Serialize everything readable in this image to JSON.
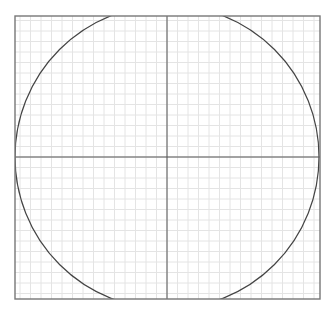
{
  "diagram": {
    "type": "circle-on-grid",
    "frame": {
      "x": 15,
      "y": 16,
      "width": 305,
      "height": 283
    },
    "center": {
      "x": 167,
      "y": 157
    },
    "circle_radius": 152,
    "grid_spacing": 10.5,
    "colors": {
      "background": "#ffffff",
      "grid": "#e4e4e4",
      "frame": "#777777",
      "axes": "#555555",
      "circle": "#444444"
    }
  }
}
